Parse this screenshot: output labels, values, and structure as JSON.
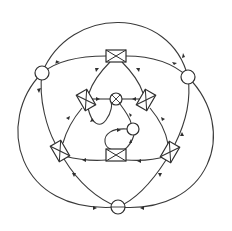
{
  "diagram": {
    "type": "knot-like planar graph with vertex gadgets",
    "stroke_color": "#3a3a3a",
    "background": "#ffffff",
    "circle_nodes": [
      {
        "id": "c-left",
        "x": 42,
        "y": 73,
        "r": 7
      },
      {
        "id": "c-right",
        "x": 188,
        "y": 77,
        "r": 7
      },
      {
        "id": "c-bottom",
        "x": 118,
        "y": 207,
        "r": 7
      },
      {
        "id": "c-center-top",
        "x": 116,
        "y": 99,
        "r": 6
      },
      {
        "id": "c-center-mid",
        "x": 133,
        "y": 129,
        "r": 6
      }
    ],
    "box_nodes": [
      {
        "id": "b-top",
        "x": 116,
        "y": 56,
        "w": 20,
        "h": 11,
        "rot": 0
      },
      {
        "id": "b-inner-left",
        "x": 86,
        "y": 100,
        "w": 18,
        "h": 11,
        "rot": 60
      },
      {
        "id": "b-inner-right",
        "x": 146,
        "y": 100,
        "w": 18,
        "h": 11,
        "rot": -60
      },
      {
        "id": "b-inner-bottom",
        "x": 116,
        "y": 155,
        "w": 20,
        "h": 11,
        "rot": 0
      },
      {
        "id": "b-lower-left",
        "x": 60,
        "y": 151,
        "w": 18,
        "h": 11,
        "rot": 60
      },
      {
        "id": "b-lower-right",
        "x": 170,
        "y": 152,
        "w": 18,
        "h": 11,
        "rot": -60
      }
    ]
  }
}
